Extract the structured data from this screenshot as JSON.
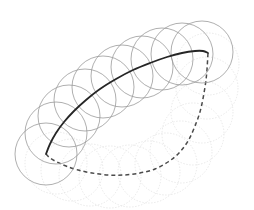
{
  "figure": {
    "canvas": {
      "width": 254,
      "height": 210,
      "background": "#ffffff"
    },
    "colors": {
      "solid_curve": "#262626",
      "dashed_curve": "#4a4a4a",
      "circle_main": "#9a9a9a",
      "circle_faded": "#e2e2e2",
      "background": "#ffffff"
    },
    "styles": {
      "solid_curve_width": 1.8,
      "dashed_curve_width": 1.5,
      "dashed_curve_dasharray": "4 3",
      "circle_main_width": 0.8,
      "circle_faded_width": 0.8,
      "circle_faded_dasharray": "1.4 1.6"
    },
    "geometry": {
      "circle_radius": 31,
      "main_curve_endpoints": {
        "start": [
          46,
          154
        ],
        "end": [
          208,
          53
        ]
      },
      "dashed_curve_endpoints": {
        "start": [
          46,
          154
        ],
        "end": [
          208,
          53
        ]
      }
    }
  },
  "chart_data": {
    "type": "line",
    "xlabel": "",
    "ylabel": "",
    "xlim": [
      0,
      254
    ],
    "ylim": [
      0,
      210
    ],
    "grid": false,
    "legend": "none",
    "series": [
      {
        "name": "solid-curve",
        "style": "solid",
        "color": "#262626",
        "x": [
          46,
          50,
          56,
          64,
          74,
          86,
          100,
          116,
          133,
          150,
          167,
          182,
          195,
          203,
          208
        ],
        "y": [
          154,
          144,
          133,
          122,
          111,
          100,
          89,
          79,
          70,
          63,
          57,
          53,
          51,
          51,
          53
        ]
      },
      {
        "name": "dashed-curve",
        "style": "dashed",
        "color": "#4a4a4a",
        "x": [
          46,
          50,
          57,
          66,
          78,
          92,
          108,
          124,
          140,
          155,
          168,
          179,
          188,
          195,
          201,
          206,
          208
        ],
        "y": [
          154,
          158,
          162,
          166,
          170,
          173,
          175,
          175,
          173,
          169,
          162,
          153,
          141,
          126,
          108,
          80,
          53
        ]
      }
    ],
    "circle_centers_main": [
      [
        46,
        154
      ],
      [
        56,
        133
      ],
      [
        69,
        116
      ],
      [
        85,
        100
      ],
      [
        103,
        87
      ],
      [
        122,
        76
      ],
      [
        142,
        67
      ],
      [
        162,
        59
      ],
      [
        182,
        54
      ],
      [
        202,
        52
      ]
    ],
    "circle_centers_faded": [
      [
        56,
        163
      ],
      [
        72,
        170
      ],
      [
        90,
        175
      ],
      [
        110,
        177
      ],
      [
        130,
        176
      ],
      [
        149,
        172
      ],
      [
        166,
        164
      ],
      [
        181,
        152
      ],
      [
        193,
        134
      ],
      [
        202,
        112
      ],
      [
        207,
        88
      ],
      [
        208,
        64
      ]
    ]
  }
}
